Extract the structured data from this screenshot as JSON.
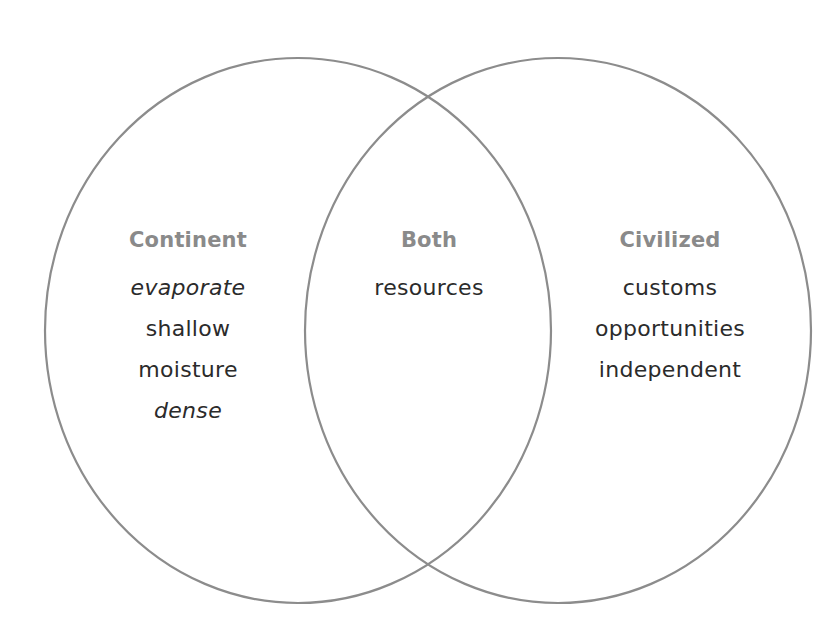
{
  "diagram": {
    "type": "venn",
    "circle_stroke_color": "#8c8c8c",
    "title_color": "#8a8a8a",
    "text_color": "#2b2b2b",
    "sets": [
      {
        "id": "left",
        "title": "Continent",
        "items": [
          "evaporate",
          "shallow",
          "moisture",
          "dense"
        ]
      },
      {
        "id": "intersection",
        "title": "Both",
        "items": [
          "resources"
        ]
      },
      {
        "id": "right",
        "title": "Civilized",
        "items": [
          "customs",
          "opportunities",
          "independent"
        ]
      }
    ]
  }
}
